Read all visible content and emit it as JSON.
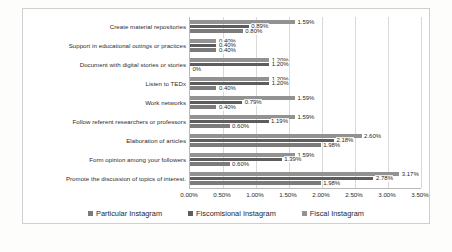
{
  "chart_data": {
    "type": "bar",
    "orientation": "horizontal",
    "title": "",
    "xlabel": "",
    "ylabel": "",
    "xlim": [
      0,
      3.5
    ],
    "xticks": [
      "0.00%",
      "0.50%",
      "1.00%",
      "1.50%",
      "2.00%",
      "2.50%",
      "3.00%",
      "3.50%"
    ],
    "xtick_values": [
      0,
      0.5,
      1.0,
      1.5,
      2.0,
      2.5,
      3.0,
      3.5
    ],
    "grid": true,
    "legend_position": "bottom",
    "categories": [
      "Create material repositories",
      "Support in educational outings or practices",
      "Document with digital stories or stories",
      "Listen to TEDx",
      "Work networks",
      "Follow referent researchers or professors",
      "Elaboration of articles",
      "Form opinion among your followers",
      "Promote the discussion of topics of interest."
    ],
    "series": [
      {
        "name": "Particular Instagram",
        "color": "#7b7b7b",
        "values": [
          0.8,
          0.4,
          0.0,
          0.4,
          0.4,
          0.6,
          1.98,
          0.6,
          1.98
        ],
        "labels": [
          "0.80%",
          "0.40%",
          "0%",
          "0.40%",
          "0.40%",
          "0.60%",
          "1.98%",
          "0.60%",
          "1.98%"
        ]
      },
      {
        "name": "Fiscomisional Instagram",
        "color": "#5d5d5d",
        "values": [
          0.89,
          0.4,
          1.2,
          1.2,
          0.79,
          1.19,
          2.18,
          1.39,
          2.78
        ],
        "labels": [
          "0.89%",
          "0.40%",
          "1.20%",
          "1.20%",
          "0.79%",
          "1.19%",
          "2.18%",
          "1.39%",
          "2.78%"
        ]
      },
      {
        "name": "Fiscal Instagram",
        "color": "#929292",
        "values": [
          1.59,
          0.4,
          1.2,
          1.2,
          1.59,
          1.59,
          2.6,
          1.59,
          3.17
        ],
        "labels": [
          "1.59%",
          "0.40%",
          "1.20%",
          "1.20%",
          "1.59%",
          "1.59%",
          "2.60%",
          "1.59%",
          "3.17%"
        ]
      }
    ]
  },
  "legend": {
    "items": [
      {
        "label": "Particular Instagram"
      },
      {
        "label": "Fiscomisional Instagram"
      },
      {
        "label": "Fiscal Instagram"
      }
    ]
  },
  "caption": ""
}
